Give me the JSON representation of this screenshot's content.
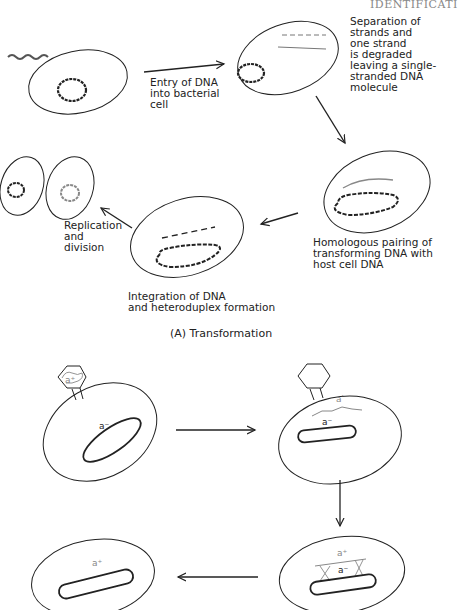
{
  "header": {
    "running_title": "IDENTIFICATI"
  },
  "panel_a": {
    "caption": "(A) Transformation",
    "steps": [
      {
        "id": "entry",
        "label": "Entry of DNA\ninto bacterial\ncell"
      },
      {
        "id": "separation",
        "label": "Separation of\nstrands and\none strand\nis degraded\nleaving a single-\nstranded DNA\nmolecule"
      },
      {
        "id": "pairing",
        "label": "Homologous pairing of\ntransforming DNA with\nhost cell DNA"
      },
      {
        "id": "integration",
        "label": "Integration of DNA\nand heteroduplex formation"
      },
      {
        "id": "replication",
        "label": "Replication\nand\ndivision"
      }
    ]
  },
  "panel_b": {
    "gene_labels": {
      "phage_head": "a+",
      "host_initial": "a−",
      "injected": "a+",
      "host_after_injection": "a−",
      "recombination_top": "a+",
      "recombination_bottom": "a−",
      "final": "a+"
    }
  },
  "colors": {
    "line": "#222222",
    "grey_strand": "#888888",
    "header": "#888888"
  }
}
